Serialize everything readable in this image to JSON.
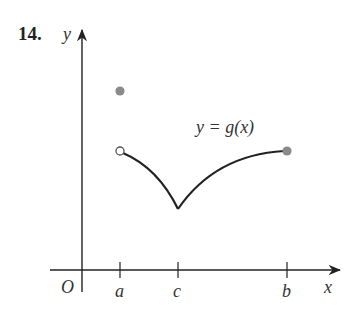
{
  "problem_number": "14.",
  "axes": {
    "y_label": "y",
    "x_label": "x",
    "origin_label": "O"
  },
  "ticks": [
    {
      "label": "a",
      "x": 120
    },
    {
      "label": "c",
      "x": 178
    },
    {
      "label": "b",
      "x": 287
    }
  ],
  "curve_label": "y = g(x)",
  "points": {
    "filled_above_a": {
      "x": 120,
      "y": 91,
      "style": "filled",
      "color": "#8a8a8a"
    },
    "open_at_a": {
      "x": 120,
      "y": 151,
      "style": "open"
    },
    "cusp_at_c": {
      "x": 178,
      "y": 209
    },
    "filled_at_b": {
      "x": 287,
      "y": 151,
      "style": "filled",
      "color": "#8a8a8a"
    }
  },
  "colors": {
    "axis": "#222222",
    "curve": "#222222",
    "dot": "#8a8a8a"
  }
}
